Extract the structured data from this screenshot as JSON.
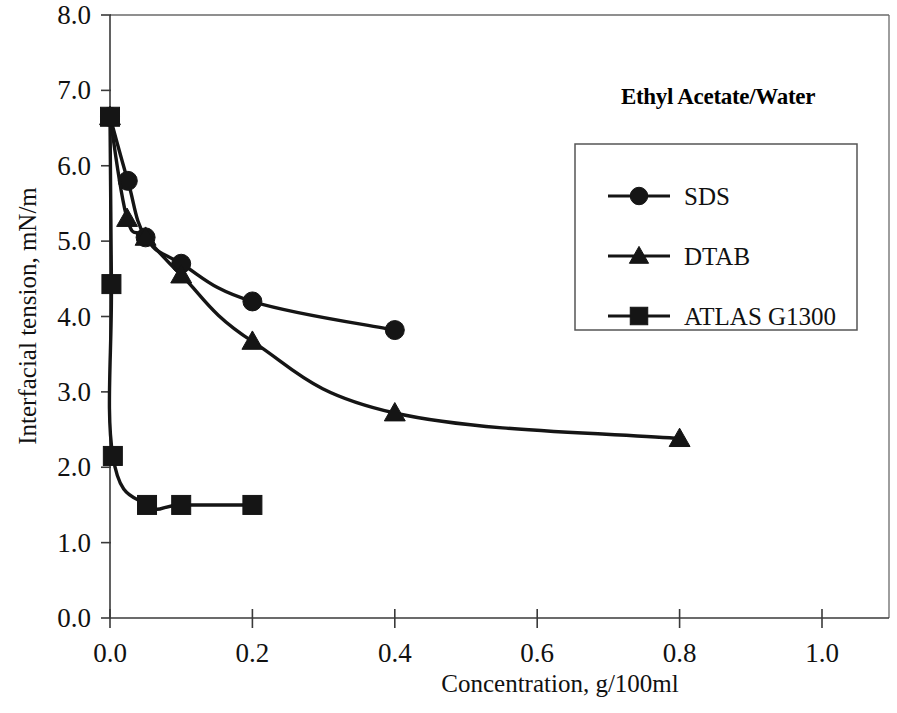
{
  "chart_data": {
    "type": "line",
    "title": "Ethyl Acetate/Water",
    "xlabel": "Concentration, g/100ml",
    "ylabel": "Interfacial tension, mN/m",
    "xlim": [
      0.0,
      1.1
    ],
    "ylim": [
      0.0,
      8.0
    ],
    "xticks": [
      0.0,
      0.2,
      0.4,
      0.6,
      0.8,
      1.0
    ],
    "xtick_labels": [
      "0.0",
      "0.2",
      "0.4",
      "0.6",
      "0.8",
      "1.0"
    ],
    "yticks": [
      0.0,
      1.0,
      2.0,
      3.0,
      4.0,
      5.0,
      6.0,
      7.0,
      8.0
    ],
    "ytick_labels": [
      "0.0",
      "1.0",
      "2.0",
      "3.0",
      "4.0",
      "5.0",
      "6.0",
      "7.0",
      "8.0"
    ],
    "grid": false,
    "legend_position": "upper-right",
    "series": [
      {
        "name": "SDS",
        "marker": "circle",
        "color": "#151515",
        "x": [
          0.0,
          0.025,
          0.05,
          0.1,
          0.2,
          0.4
        ],
        "y": [
          6.65,
          5.8,
          5.05,
          4.7,
          4.2,
          3.82
        ]
      },
      {
        "name": "DTAB",
        "marker": "triangle",
        "color": "#151515",
        "x": [
          0.0,
          0.024,
          0.05,
          0.1,
          0.2,
          0.4,
          0.8
        ],
        "y": [
          6.65,
          5.3,
          5.05,
          4.55,
          3.67,
          2.72,
          2.38
        ]
      },
      {
        "name": "ATLAS G1300",
        "marker": "square",
        "color": "#151515",
        "x": [
          0.0,
          0.002,
          0.004,
          0.052,
          0.1,
          0.2
        ],
        "y": [
          6.65,
          4.43,
          2.15,
          1.5,
          1.5,
          1.5
        ]
      }
    ]
  },
  "legend": {
    "title": "Ethyl Acetate/Water",
    "entries": [
      {
        "label": "SDS",
        "marker": "circle"
      },
      {
        "label": "DTAB",
        "marker": "triangle"
      },
      {
        "label": "ATLAS G1300",
        "marker": "square"
      }
    ]
  },
  "axes": {
    "x_title": "Concentration, g/100ml",
    "y_title": "Interfacial tension, mN/m"
  }
}
